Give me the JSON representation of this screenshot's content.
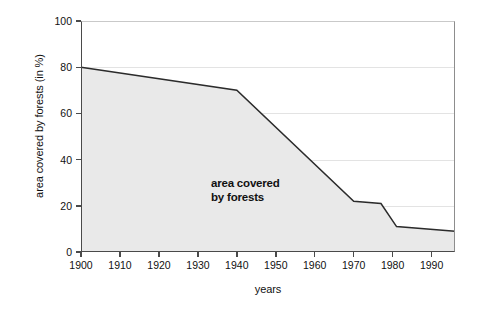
{
  "chart_data": {
    "type": "area",
    "title": "",
    "xlabel": "years",
    "ylabel": "area covered by forests (in %)",
    "xlim": [
      1900,
      1996
    ],
    "ylim": [
      0,
      100
    ],
    "grid": true,
    "legend": "none",
    "annotations": [
      {
        "text_line1": "area covered",
        "text_line2": "by forests",
        "x": 1912,
        "y": 42
      }
    ],
    "xticks": [
      1900,
      1910,
      1920,
      1930,
      1940,
      1950,
      1960,
      1970,
      1980,
      1990
    ],
    "yticks": [
      0,
      20,
      40,
      60,
      80,
      100
    ],
    "series": [
      {
        "name": "area covered by forests",
        "x": [
          1900,
          1940,
          1970,
          1977,
          1981,
          1996
        ],
        "values": [
          80,
          70,
          22,
          21,
          11,
          9
        ]
      }
    ]
  },
  "style": {
    "fill_color": "#e9e9e9",
    "line_color": "#2b2b2b",
    "axis_color": "#4a4a4a",
    "grid_color": "#e3e3e3",
    "background": "#ffffff"
  }
}
